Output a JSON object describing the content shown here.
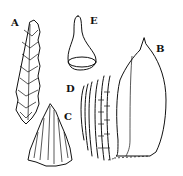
{
  "figure": {
    "type": "botanical-illustration",
    "panels": [
      {
        "label": "A",
        "depicts": "leafy shoot"
      },
      {
        "label": "B",
        "depicts": "leaf"
      },
      {
        "label": "C",
        "depicts": "leaf apex cells"
      },
      {
        "label": "D",
        "depicts": "leaf base cells"
      },
      {
        "label": "E",
        "depicts": "calyptra"
      }
    ]
  }
}
